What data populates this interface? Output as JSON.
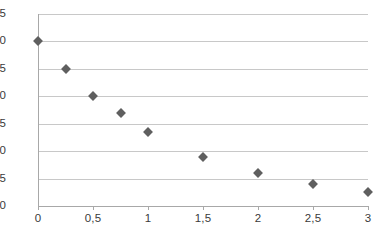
{
  "chart_data": {
    "type": "scatter",
    "title": "",
    "subtitle": "",
    "xlabel": "",
    "ylabel": "",
    "xlim": [
      0,
      3
    ],
    "ylim": [
      0,
      3.5
    ],
    "grid": true,
    "legend": "none",
    "decimal_separator": ",",
    "marker_shape": "diamond",
    "marker_color": "#5f5f5f",
    "gridline_color": "#c8c8c8",
    "axis_color": "#a8a8a8",
    "x_ticks": [
      0,
      0.5,
      1,
      1.5,
      2,
      2.5,
      3
    ],
    "x_tick_labels": [
      "0",
      "0,5",
      "1",
      "1,5",
      "2",
      "2,5",
      "3"
    ],
    "y_ticks": [
      0,
      0.5,
      1,
      1.5,
      2,
      2.5,
      3,
      3.5
    ],
    "y_tick_labels": [
      "0,0",
      "0,5",
      "1,0",
      "1,5",
      "2,0",
      "2,5",
      "3,0",
      "3,5"
    ],
    "series": [
      {
        "name": "series-1",
        "points": [
          {
            "x": 0,
            "y": 3.0
          },
          {
            "x": 0.25,
            "y": 2.5
          },
          {
            "x": 0.5,
            "y": 2.0
          },
          {
            "x": 0.75,
            "y": 1.7
          },
          {
            "x": 1,
            "y": 1.35
          },
          {
            "x": 1.5,
            "y": 0.9
          },
          {
            "x": 2,
            "y": 0.6
          },
          {
            "x": 2.5,
            "y": 0.4
          },
          {
            "x": 3,
            "y": 0.25
          }
        ]
      }
    ]
  }
}
